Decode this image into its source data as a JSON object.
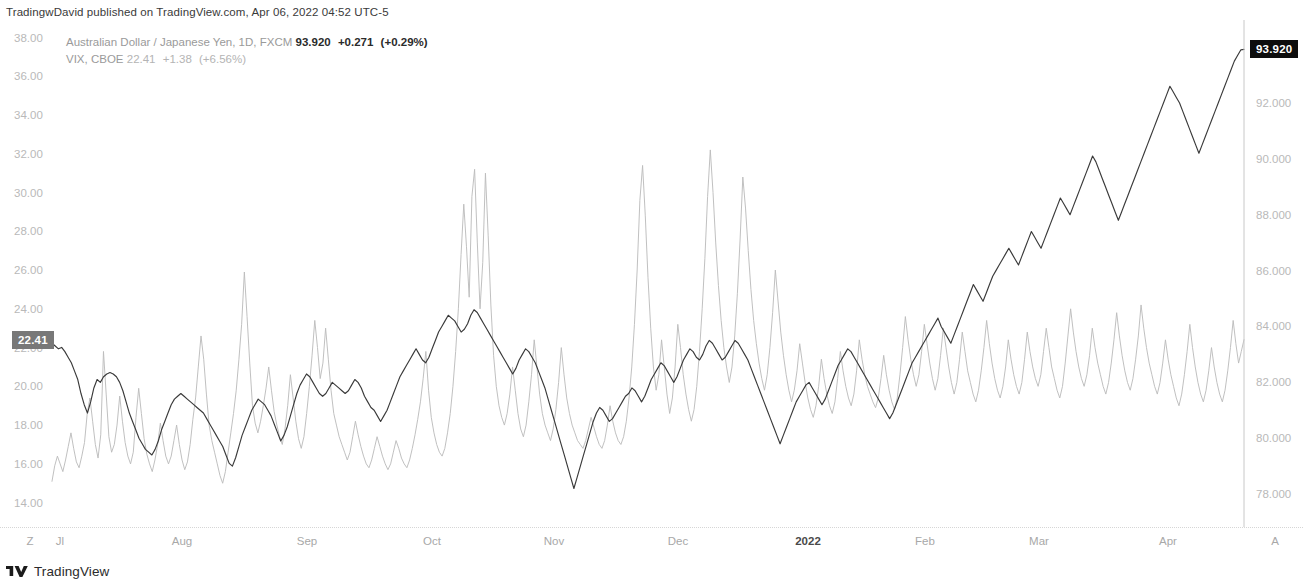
{
  "header": {
    "published_text": "TradingwDavid published on TradingView.com, Apr 06, 2022 04:52 UTC-5"
  },
  "legend": {
    "series1": {
      "symbol": "Australian Dollar / Japanese Yen, 1D, FXCM",
      "last": "93.920",
      "change": "+0.271",
      "change_pct": "(+0.29%)"
    },
    "series2": {
      "symbol": "VIX, CBOE",
      "last": "22.41",
      "change": "+1.38",
      "change_pct": "(+6.56%)"
    }
  },
  "price_badges": {
    "left": {
      "value": "22.41",
      "color": "#787878"
    },
    "right": {
      "value": "93.920",
      "color": "#0d0d0d"
    }
  },
  "footer": {
    "brand": "TradingView"
  },
  "chart_data": {
    "type": "line",
    "title": "",
    "xlabel": "",
    "ylabel": "",
    "grid": false,
    "legend_position": "top-left",
    "left_axis": {
      "label": "VIX",
      "ticks": [
        "38.00",
        "36.00",
        "34.00",
        "32.00",
        "30.00",
        "28.00",
        "26.00",
        "24.00",
        "22.00",
        "20.00",
        "18.00",
        "16.00",
        "14.00"
      ],
      "ylim": [
        13.0,
        38.8
      ]
    },
    "right_axis": {
      "label": "AUDJPY",
      "ticks": [
        "92.000",
        "90.000",
        "88.000",
        "86.000",
        "84.000",
        "82.000",
        "80.000",
        "78.000"
      ],
      "ylim": [
        77.0,
        94.9
      ]
    },
    "x_ticks": [
      {
        "label": "Z",
        "bold": false,
        "x": 30
      },
      {
        "label": "Jl",
        "bold": false,
        "x": 60
      },
      {
        "label": "Aug",
        "bold": false,
        "x": 182
      },
      {
        "label": "Sep",
        "bold": false,
        "x": 307
      },
      {
        "label": "Oct",
        "bold": false,
        "x": 432
      },
      {
        "label": "Nov",
        "bold": false,
        "x": 554
      },
      {
        "label": "Dec",
        "bold": false,
        "x": 678
      },
      {
        "label": "2022",
        "bold": true,
        "x": 808
      },
      {
        "label": "Feb",
        "bold": false,
        "x": 925
      },
      {
        "label": "Mar",
        "bold": false,
        "x": 1039
      },
      {
        "label": "Apr",
        "bold": false,
        "x": 1168
      },
      {
        "label": "A",
        "bold": false,
        "x": 1275
      }
    ],
    "series": [
      {
        "name": "VIX, CBOE",
        "axis": "left",
        "color": "#bdbdbd",
        "values": [
          15.1,
          15.9,
          16.4,
          16.0,
          15.6,
          16.2,
          16.9,
          17.6,
          16.8,
          16.1,
          15.8,
          16.4,
          17.1,
          18.6,
          19.4,
          18.2,
          17.0,
          16.3,
          17.5,
          21.8,
          19.6,
          17.4,
          16.6,
          17.0,
          18.0,
          19.5,
          18.2,
          17.1,
          16.4,
          16.0,
          16.6,
          18.4,
          19.9,
          18.6,
          17.3,
          16.5,
          16.0,
          15.6,
          16.2,
          17.0,
          18.1,
          17.2,
          16.4,
          16.0,
          16.4,
          17.2,
          18.0,
          17.0,
          16.2,
          15.7,
          16.1,
          17.0,
          18.3,
          19.4,
          21.0,
          22.6,
          21.4,
          19.6,
          18.0,
          17.2,
          16.6,
          16.0,
          15.4,
          15.0,
          15.6,
          16.6,
          17.6,
          18.6,
          19.8,
          21.4,
          23.2,
          25.9,
          23.6,
          21.2,
          19.0,
          18.1,
          17.6,
          18.2,
          19.0,
          19.9,
          21.0,
          19.8,
          18.7,
          18.0,
          17.4,
          17.0,
          17.8,
          19.0,
          20.6,
          19.4,
          18.2,
          17.3,
          16.8,
          17.4,
          18.6,
          20.0,
          21.6,
          23.4,
          22.0,
          20.4,
          21.2,
          23.0,
          21.4,
          19.8,
          18.6,
          18.0,
          17.4,
          17.0,
          16.6,
          16.2,
          16.6,
          17.4,
          18.2,
          17.5,
          16.9,
          16.4,
          16.0,
          15.8,
          16.2,
          16.8,
          17.4,
          16.9,
          16.4,
          16.0,
          15.7,
          16.0,
          16.6,
          17.2,
          16.8,
          16.3,
          16.0,
          15.8,
          16.2,
          16.8,
          17.5,
          18.3,
          19.2,
          20.4,
          21.8,
          19.8,
          18.4,
          17.6,
          17.0,
          16.6,
          16.4,
          16.8,
          17.6,
          18.6,
          20.0,
          21.8,
          24.0,
          26.8,
          29.4,
          27.2,
          24.6,
          29.8,
          31.2,
          27.4,
          24.0,
          26.4,
          31.0,
          27.8,
          24.2,
          21.6,
          20.0,
          19.0,
          18.4,
          18.0,
          18.6,
          19.6,
          21.0,
          19.8,
          18.6,
          17.8,
          17.4,
          18.0,
          19.2,
          20.6,
          22.4,
          21.0,
          19.6,
          18.6,
          18.0,
          17.6,
          17.2,
          17.8,
          18.8,
          20.2,
          22.0,
          20.6,
          19.4,
          18.6,
          18.0,
          17.6,
          17.2,
          17.0,
          16.8,
          17.2,
          17.8,
          18.4,
          17.9,
          17.4,
          17.0,
          16.8,
          17.2,
          18.0,
          19.0,
          18.2,
          17.6,
          17.2,
          17.0,
          17.4,
          18.2,
          19.4,
          21.0,
          23.2,
          26.0,
          29.6,
          31.4,
          28.8,
          25.6,
          23.0,
          21.0,
          19.8,
          20.6,
          22.4,
          21.0,
          19.6,
          18.6,
          19.4,
          21.0,
          23.2,
          22.0,
          20.6,
          19.6,
          18.8,
          18.2,
          18.8,
          20.0,
          21.8,
          24.0,
          26.6,
          29.8,
          32.2,
          30.0,
          27.4,
          25.2,
          23.4,
          22.0,
          21.0,
          20.2,
          21.0,
          22.6,
          24.8,
          27.6,
          30.8,
          29.2,
          27.0,
          25.0,
          23.4,
          22.2,
          21.2,
          20.4,
          19.8,
          20.6,
          22.0,
          23.8,
          26.0,
          24.4,
          22.8,
          21.6,
          20.6,
          19.8,
          19.2,
          19.8,
          20.8,
          22.2,
          21.2,
          20.2,
          19.4,
          18.8,
          18.4,
          19.0,
          20.0,
          21.4,
          20.4,
          19.6,
          19.0,
          18.6,
          19.2,
          20.4,
          21.8,
          20.8,
          20.0,
          19.4,
          19.0,
          19.6,
          20.8,
          22.4,
          21.4,
          20.6,
          20.0,
          19.6,
          19.2,
          18.9,
          19.4,
          20.4,
          21.6,
          20.6,
          19.8,
          19.2,
          18.8,
          19.4,
          20.6,
          22.0,
          23.6,
          22.4,
          21.4,
          20.6,
          20.0,
          20.6,
          21.8,
          23.2,
          22.2,
          21.2,
          20.4,
          19.8,
          20.4,
          21.6,
          23.0,
          22.0,
          21.0,
          20.2,
          19.6,
          20.2,
          21.4,
          22.8,
          21.8,
          20.8,
          20.2,
          19.6,
          19.2,
          19.8,
          20.8,
          22.0,
          23.4,
          22.2,
          21.2,
          20.4,
          19.8,
          19.4,
          20.0,
          21.0,
          22.4,
          21.4,
          20.6,
          20.0,
          19.6,
          20.2,
          21.4,
          22.8,
          21.8,
          21.0,
          20.4,
          20.0,
          20.6,
          21.8,
          23.0,
          22.0,
          21.0,
          20.4,
          19.8,
          19.4,
          20.0,
          21.2,
          22.6,
          24.0,
          22.8,
          21.8,
          21.0,
          20.4,
          20.0,
          20.6,
          21.6,
          23.0,
          22.0,
          21.2,
          20.6,
          20.0,
          19.6,
          20.2,
          21.2,
          22.4,
          23.8,
          22.6,
          21.6,
          20.8,
          20.2,
          19.8,
          20.4,
          21.4,
          22.6,
          24.2,
          23.0,
          22.0,
          21.2,
          20.6,
          20.0,
          19.6,
          20.2,
          21.2,
          22.4,
          21.4,
          20.6,
          20.0,
          19.4,
          19.0,
          19.6,
          20.6,
          21.8,
          23.2,
          22.0,
          21.0,
          20.2,
          19.6,
          19.2,
          19.8,
          20.8,
          22.0,
          21.0,
          20.2,
          19.6,
          19.2,
          19.8,
          20.8,
          22.0,
          23.4,
          22.2,
          21.2,
          21.8,
          22.41
        ],
        "final_value": 22.41
      },
      {
        "name": "Australian Dollar / Japanese Yen, 1D, FXCM",
        "axis": "right",
        "color": "#3a3a3a",
        "values": [
          83.4,
          83.3,
          83.2,
          83.25,
          83.1,
          82.9,
          82.7,
          82.4,
          82.1,
          81.6,
          81.2,
          80.9,
          81.3,
          81.8,
          82.1,
          82.0,
          82.2,
          82.3,
          82.35,
          82.3,
          82.2,
          82.0,
          81.7,
          81.3,
          80.9,
          80.6,
          80.3,
          80.0,
          79.8,
          79.6,
          79.5,
          79.4,
          79.6,
          79.9,
          80.3,
          80.6,
          80.9,
          81.2,
          81.4,
          81.5,
          81.6,
          81.5,
          81.4,
          81.3,
          81.2,
          81.1,
          81.0,
          80.9,
          80.7,
          80.5,
          80.3,
          80.1,
          79.9,
          79.7,
          79.4,
          79.1,
          79.0,
          79.3,
          79.7,
          80.1,
          80.4,
          80.7,
          81.0,
          81.2,
          81.4,
          81.3,
          81.2,
          81.0,
          80.8,
          80.5,
          80.2,
          79.9,
          80.1,
          80.4,
          80.8,
          81.2,
          81.6,
          81.9,
          82.1,
          82.3,
          82.2,
          82.0,
          81.8,
          81.6,
          81.5,
          81.6,
          81.8,
          82.0,
          81.9,
          81.8,
          81.7,
          81.6,
          81.7,
          81.9,
          82.1,
          82.0,
          81.8,
          81.5,
          81.3,
          81.1,
          81.0,
          80.8,
          80.6,
          80.8,
          81.0,
          81.3,
          81.6,
          81.9,
          82.2,
          82.4,
          82.6,
          82.8,
          83.0,
          83.2,
          83.0,
          82.8,
          82.7,
          82.9,
          83.2,
          83.5,
          83.8,
          84.0,
          84.2,
          84.4,
          84.3,
          84.2,
          84.0,
          83.8,
          83.9,
          84.1,
          84.4,
          84.6,
          84.5,
          84.3,
          84.1,
          83.9,
          83.7,
          83.5,
          83.3,
          83.1,
          82.9,
          82.7,
          82.5,
          82.3,
          82.5,
          82.8,
          83.0,
          83.2,
          83.1,
          82.9,
          82.7,
          82.4,
          82.1,
          81.8,
          81.4,
          81.0,
          80.6,
          80.2,
          79.8,
          79.4,
          79.0,
          78.6,
          78.2,
          78.6,
          79.0,
          79.4,
          79.8,
          80.2,
          80.6,
          80.9,
          81.1,
          81.0,
          80.8,
          80.6,
          80.7,
          80.9,
          81.1,
          81.3,
          81.5,
          81.6,
          81.8,
          81.7,
          81.5,
          81.3,
          81.5,
          81.8,
          82.1,
          82.3,
          82.5,
          82.7,
          82.6,
          82.4,
          82.2,
          82.0,
          82.2,
          82.5,
          82.8,
          83.0,
          83.2,
          83.1,
          82.9,
          82.8,
          83.0,
          83.3,
          83.5,
          83.4,
          83.2,
          83.0,
          82.8,
          82.9,
          83.1,
          83.3,
          83.5,
          83.4,
          83.2,
          83.0,
          82.8,
          82.5,
          82.2,
          81.9,
          81.6,
          81.3,
          81.0,
          80.7,
          80.4,
          80.1,
          79.8,
          80.1,
          80.4,
          80.7,
          81.0,
          81.3,
          81.5,
          81.7,
          81.9,
          82.0,
          81.8,
          81.6,
          81.4,
          81.2,
          81.4,
          81.7,
          82.0,
          82.3,
          82.6,
          82.8,
          83.0,
          83.2,
          83.1,
          82.9,
          82.7,
          82.5,
          82.3,
          82.1,
          81.9,
          81.7,
          81.5,
          81.3,
          81.1,
          80.9,
          80.7,
          80.9,
          81.2,
          81.5,
          81.8,
          82.1,
          82.4,
          82.7,
          82.9,
          83.1,
          83.3,
          83.5,
          83.7,
          83.9,
          84.1,
          84.3,
          84.0,
          83.8,
          83.6,
          83.4,
          83.7,
          84.0,
          84.3,
          84.6,
          84.9,
          85.2,
          85.5,
          85.3,
          85.1,
          84.9,
          85.2,
          85.5,
          85.8,
          86.0,
          86.2,
          86.4,
          86.6,
          86.8,
          86.6,
          86.4,
          86.2,
          86.5,
          86.8,
          87.1,
          87.4,
          87.2,
          87.0,
          86.8,
          87.1,
          87.4,
          87.7,
          88.0,
          88.3,
          88.6,
          88.4,
          88.2,
          88.0,
          88.3,
          88.6,
          88.9,
          89.2,
          89.5,
          89.8,
          90.1,
          89.9,
          89.6,
          89.3,
          89.0,
          88.7,
          88.4,
          88.1,
          87.8,
          88.1,
          88.4,
          88.7,
          89.0,
          89.3,
          89.6,
          89.9,
          90.2,
          90.5,
          90.8,
          91.1,
          91.4,
          91.7,
          92.0,
          92.3,
          92.6,
          92.4,
          92.2,
          92.0,
          91.7,
          91.4,
          91.1,
          90.8,
          90.5,
          90.2,
          90.5,
          90.8,
          91.1,
          91.4,
          91.7,
          92.0,
          92.3,
          92.6,
          92.9,
          93.2,
          93.5,
          93.7,
          93.9,
          93.92
        ],
        "final_value": 93.92
      }
    ]
  }
}
